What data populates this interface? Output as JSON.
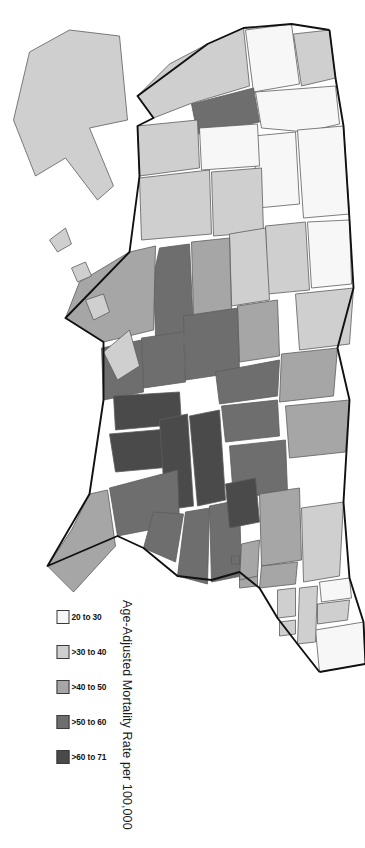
{
  "figure": {
    "kind": "choropleth-map",
    "region": "United States",
    "background": "#ffffff",
    "rotation_degrees": 90
  },
  "legend": {
    "title": "Age-Adjusted Mortality Rate per 100,000",
    "orientation": "horizontal-swatches",
    "classes": [
      {
        "label": "20 to 30",
        "color": "#f7f7f7",
        "min": 20,
        "max": 30
      },
      {
        "label": ">30 to 40",
        "color": "#cfcfcf",
        "min": 30,
        "max": 40
      },
      {
        "label": ">40 to 50",
        "color": "#a6a6a6",
        "min": 40,
        "max": 50
      },
      {
        "label": ">50 to 60",
        "color": "#6e6e6e",
        "min": 50,
        "max": 60
      },
      {
        "label": ">60 to 71",
        "color": "#4a4a4a",
        "min": 60,
        "max": 71
      }
    ]
  },
  "chart_data": {
    "type": "map",
    "title": "Age-Adjusted Mortality Rate per 100,000",
    "value_unit": "deaths per 100,000",
    "classes": [
      "20 to 30",
      ">30 to 40",
      ">40 to 50",
      ">50 to 60",
      ">60 to 71"
    ],
    "class_colors": [
      "#f7f7f7",
      "#cfcfcf",
      "#a6a6a6",
      "#6e6e6e",
      "#4a4a4a"
    ],
    "features": [
      {
        "id": "ME",
        "name": "Maine",
        "class": 1
      },
      {
        "id": "NH",
        "name": "New Hampshire",
        "class": 2
      },
      {
        "id": "VT",
        "name": "Vermont",
        "class": 1
      },
      {
        "id": "MA",
        "name": "Massachusetts",
        "class": 2
      },
      {
        "id": "RI",
        "name": "Rhode Island",
        "class": 2
      },
      {
        "id": "CT",
        "name": "Connecticut",
        "class": 2
      },
      {
        "id": "NY",
        "name": "New York",
        "class": 2
      },
      {
        "id": "NJ",
        "name": "New Jersey",
        "class": 3
      },
      {
        "id": "PA",
        "name": "Pennsylvania",
        "class": 3
      },
      {
        "id": "DE",
        "name": "Delaware",
        "class": 3
      },
      {
        "id": "MD",
        "name": "Maryland",
        "class": 3
      },
      {
        "id": "DC",
        "name": "District of Columbia",
        "class": 4
      },
      {
        "id": "VA",
        "name": "Virginia",
        "class": 4
      },
      {
        "id": "WV",
        "name": "West Virginia",
        "class": 5
      },
      {
        "id": "NC",
        "name": "North Carolina",
        "class": 4
      },
      {
        "id": "SC",
        "name": "South Carolina",
        "class": 4
      },
      {
        "id": "GA",
        "name": "Georgia",
        "class": 4
      },
      {
        "id": "FL",
        "name": "Florida",
        "class": 3
      },
      {
        "id": "AL",
        "name": "Alabama",
        "class": 5
      },
      {
        "id": "MS",
        "name": "Mississippi",
        "class": 5
      },
      {
        "id": "TN",
        "name": "Tennessee",
        "class": 5
      },
      {
        "id": "KY",
        "name": "Kentucky",
        "class": 5
      },
      {
        "id": "OH",
        "name": "Ohio",
        "class": 4
      },
      {
        "id": "IN",
        "name": "Indiana",
        "class": 4
      },
      {
        "id": "MI",
        "name": "Michigan",
        "class": 3
      },
      {
        "id": "IL",
        "name": "Illinois",
        "class": 4
      },
      {
        "id": "WI",
        "name": "Wisconsin",
        "class": 3
      },
      {
        "id": "MN",
        "name": "Minnesota",
        "class": 2
      },
      {
        "id": "IA",
        "name": "Iowa",
        "class": 3
      },
      {
        "id": "MO",
        "name": "Missouri",
        "class": 4
      },
      {
        "id": "AR",
        "name": "Arkansas",
        "class": 4
      },
      {
        "id": "LA",
        "name": "Louisiana",
        "class": 4
      },
      {
        "id": "TX",
        "name": "Texas",
        "class": 3
      },
      {
        "id": "OK",
        "name": "Oklahoma",
        "class": 4
      },
      {
        "id": "KS",
        "name": "Kansas",
        "class": 3
      },
      {
        "id": "NE",
        "name": "Nebraska",
        "class": 2
      },
      {
        "id": "SD",
        "name": "South Dakota",
        "class": 2
      },
      {
        "id": "ND",
        "name": "North Dakota",
        "class": 1
      },
      {
        "id": "MT",
        "name": "Montana",
        "class": 1
      },
      {
        "id": "WY",
        "name": "Wyoming",
        "class": 1
      },
      {
        "id": "CO",
        "name": "Colorado",
        "class": 2
      },
      {
        "id": "NM",
        "name": "New Mexico",
        "class": 2
      },
      {
        "id": "AZ",
        "name": "Arizona",
        "class": 2
      },
      {
        "id": "UT",
        "name": "Utah",
        "class": 1
      },
      {
        "id": "NV",
        "name": "Nevada",
        "class": 4
      },
      {
        "id": "ID",
        "name": "Idaho",
        "class": 1
      },
      {
        "id": "WA",
        "name": "Washington",
        "class": 2
      },
      {
        "id": "OR",
        "name": "Oregon",
        "class": 1
      },
      {
        "id": "CA",
        "name": "California",
        "class": 2
      },
      {
        "id": "AK",
        "name": "Alaska",
        "class": 2
      },
      {
        "id": "HI",
        "name": "Hawaii",
        "class": 2
      }
    ]
  }
}
